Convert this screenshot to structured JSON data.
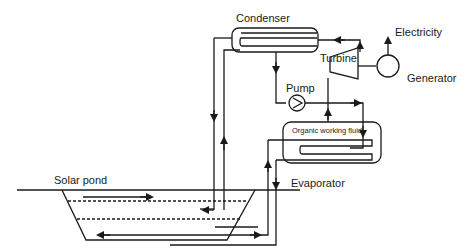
{
  "diagram": {
    "labels": {
      "condenser": "Condenser",
      "turbine": "Turbine",
      "electricity": "Electricity",
      "generator": "Generator",
      "pump": "Pump",
      "organic_fluid": "Organic working fluid",
      "evaporator": "Evaporator",
      "solar_pond": "Solar pond"
    },
    "components": [
      "Condenser",
      "Turbine",
      "Generator",
      "Pump",
      "Evaporator",
      "Solar pond"
    ],
    "colors": {
      "line": "#1a1a1a",
      "background": "#ffffff"
    }
  }
}
